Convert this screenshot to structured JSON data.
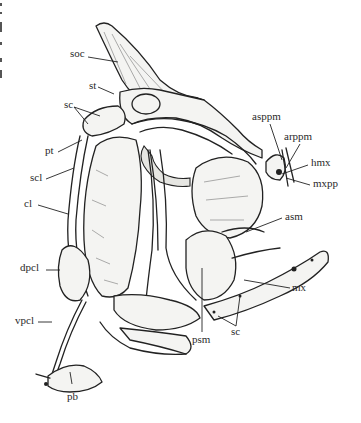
{
  "figure": {
    "background": "#ffffff",
    "ink_color": "#222222"
  },
  "labels": [
    {
      "id": "soc",
      "text": "soc",
      "x": 70,
      "y": 53
    },
    {
      "id": "st",
      "text": "st",
      "x": 89,
      "y": 84
    },
    {
      "id": "sc_top",
      "text": "sc",
      "x": 64,
      "y": 104
    },
    {
      "id": "pt",
      "text": "pt",
      "x": 45,
      "y": 150
    },
    {
      "id": "scl",
      "text": "scl",
      "x": 30,
      "y": 177
    },
    {
      "id": "cl",
      "text": "cl",
      "x": 24,
      "y": 203
    },
    {
      "id": "dpcl",
      "text": "dpcl",
      "x": 20,
      "y": 267
    },
    {
      "id": "vpcl",
      "text": "vpcl",
      "x": 15,
      "y": 320
    },
    {
      "id": "pb",
      "text": "pb",
      "x": 67,
      "y": 395
    },
    {
      "id": "asppm",
      "text": "asppm",
      "x": 254,
      "y": 116
    },
    {
      "id": "arppm",
      "text": "arppm",
      "x": 285,
      "y": 136
    },
    {
      "id": "hmx",
      "text": "hmx",
      "x": 311,
      "y": 162
    },
    {
      "id": "mxpp",
      "text": "mxpp",
      "x": 313,
      "y": 182
    },
    {
      "id": "asm",
      "text": "asm",
      "x": 285,
      "y": 215
    },
    {
      "id": "mx",
      "text": "mx",
      "x": 292,
      "y": 286
    },
    {
      "id": "psm",
      "text": "psm",
      "x": 193,
      "y": 335
    },
    {
      "id": "sc_bot",
      "text": "sc",
      "x": 230,
      "y": 328
    }
  ]
}
